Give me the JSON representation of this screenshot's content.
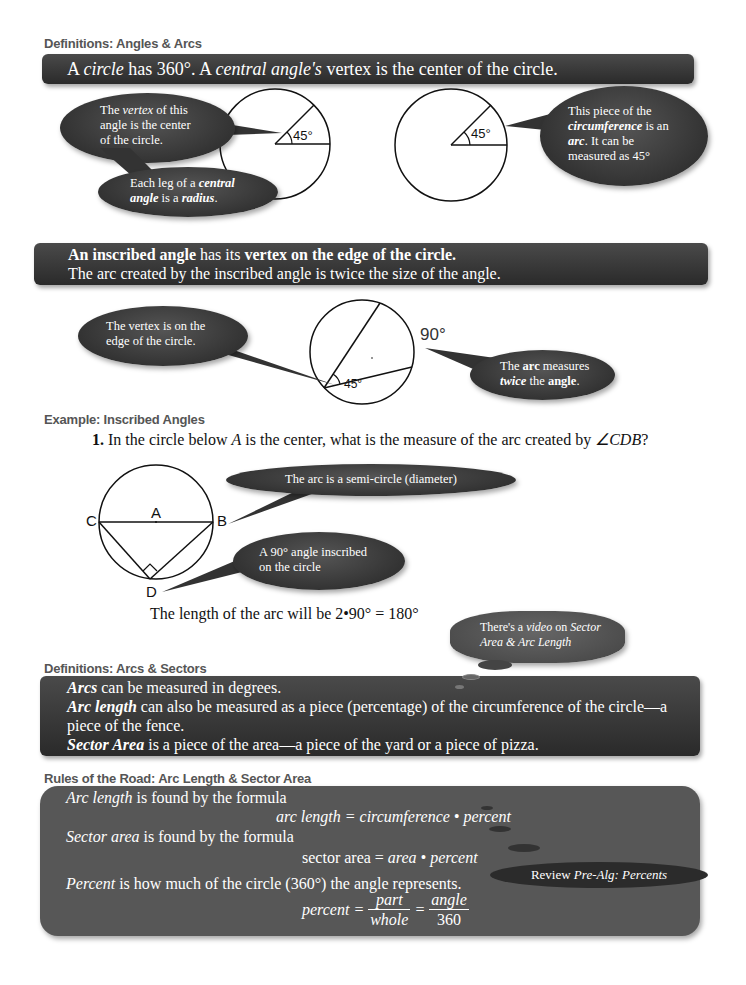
{
  "sections": {
    "angles_arcs": {
      "heading": "Definitions:  Angles & Arcs",
      "banner": {
        "p1": "A ",
        "circle": "circle",
        "p2": " has 360°.  A ",
        "central": "central angle's",
        "p3": " vertex is the center of the circle."
      },
      "bubble_vertex": {
        "l1a": "The ",
        "l1b": "vertex",
        "l1c": " of this",
        "l2": "angle is the center",
        "l3": "of the circle."
      },
      "bubble_leg": {
        "l1a": "Each leg of a ",
        "l1b": "central",
        "l2a": "angle",
        "l2b": " is a ",
        "l2c": "radius",
        "l2d": "."
      },
      "bubble_arc": {
        "l1": "This piece of the",
        "l2a": "circumference",
        "l2b": " is an",
        "l3a": "arc",
        "l3b": ".  It can be",
        "l4": "measured as 45°"
      },
      "angle_label_1": "45°",
      "angle_label_2": "45°"
    },
    "inscribed": {
      "banner": {
        "l1a": "An inscribed angle",
        "l1b": " has its ",
        "l1c": "vertex on the edge of the circle.",
        "l2": "The arc created by the inscribed angle is twice the size of the angle."
      },
      "bubble_vertex": {
        "l1": "The vertex is on the",
        "l2": "edge of the circle."
      },
      "bubble_arc": {
        "l1a": "The ",
        "l1b": "arc",
        "l1c": " measures",
        "l2a": "twice",
        "l2b": " the ",
        "l2c": "angle",
        "l2d": "."
      },
      "angle_label": "45°",
      "arc_label": "90°"
    },
    "example": {
      "heading": "Example:  Inscribed Angles",
      "question_num": "1.",
      "question_a": " In the circle below ",
      "question_var": "A",
      "question_b": " is the center, what is the measure of the arc created by ",
      "question_angle": "∠CDB",
      "question_c": "?",
      "points": {
        "C": "C",
        "A": "A",
        "B": "B",
        "D": "D"
      },
      "bubble_semicircle": "The arc is a semi-circle (diameter)",
      "bubble_90": {
        "l1": "A 90° angle inscribed",
        "l2": "on the circle"
      },
      "answer": "The length of the arc will be  2•90° = 180°"
    },
    "video_note": {
      "l1a": "There's a ",
      "l1b": "video",
      "l1c": " on ",
      "l1d": "Sector",
      "l2": "Area & Arc Length"
    },
    "arcs_sectors": {
      "heading": "Definitions:  Arcs & Sectors",
      "line1a": "Arcs",
      "line1b": " can be measured in degrees.",
      "line2a": "Arc length",
      "line2b": " can also be measured as a piece (percentage) of the circumference of the circle—a",
      "line2c": "piece of the fence.",
      "line3a": "Sector Area",
      "line3b": " is a piece of the area—a piece of the yard or a piece of pizza."
    },
    "rules": {
      "heading": "Rules of the Road:  Arc Length & Sector Area",
      "arc_intro_a": "Arc length",
      "arc_intro_b": " is found by the formula",
      "arc_formula": "arc length = circumference • percent",
      "sector_intro_a": "Sector area",
      "sector_intro_b": " is found by the formula",
      "sector_formula_a": "sector area = ",
      "sector_formula_b": "area • percent",
      "percent_intro_a": "Percent",
      "percent_intro_b": " is how much of the circle (360°) the angle represents.",
      "percent_lhs": "percent =",
      "frac1_num": "part",
      "frac1_den": "whole",
      "eq": "=",
      "frac2_num": "angle",
      "frac2_den": "360",
      "review_a": "Review ",
      "review_b": "Pre-Alg: Percents"
    }
  },
  "colors": {
    "banner_dark": "#2e2e2e",
    "rules_panel": "#555555",
    "heading_gray": "#555555"
  }
}
